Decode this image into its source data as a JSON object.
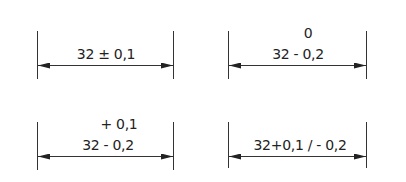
{
  "diagram": {
    "dimensions": [
      {
        "id": "symmetric",
        "nominal": "32",
        "main_text": "32 ± 0,1",
        "upper_text": "",
        "arrow_type": "double-arrow"
      },
      {
        "id": "lower-only",
        "nominal": "32",
        "main_text": "32 - 0,2",
        "upper_text": "0",
        "arrow_type": "double-arrow"
      },
      {
        "id": "stacked-asymmetric",
        "nominal": "32",
        "main_text": "32 - 0,2",
        "upper_text": "+ 0,1",
        "arrow_type": "double-arrow"
      },
      {
        "id": "inline-asymmetric",
        "nominal": "32",
        "main_text": "32+0,1 / - 0,2",
        "upper_text": "",
        "arrow_type": "double-arrow"
      }
    ],
    "colors": {
      "line": "#222222",
      "background": "#ffffff"
    }
  }
}
